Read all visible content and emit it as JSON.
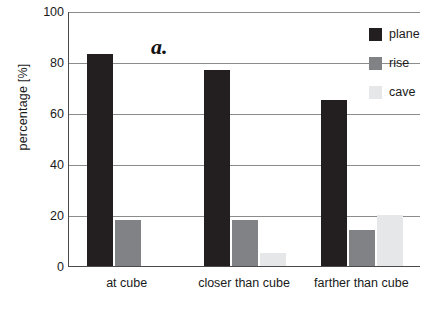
{
  "chart_data": {
    "type": "bar",
    "title": "",
    "panel_label": "a.",
    "xlabel": "",
    "ylabel": "percentage [%]",
    "ylim": [
      0,
      100
    ],
    "yticks": [
      0,
      20,
      40,
      60,
      80,
      100
    ],
    "grid": true,
    "legend_position": "top-right",
    "categories": [
      "at cube",
      "closer than cube",
      "farther than cube"
    ],
    "series": [
      {
        "name": "plane",
        "color": "#231f20",
        "values": [
          83,
          77,
          65
        ]
      },
      {
        "name": "rise",
        "color": "#808285",
        "values": [
          18,
          18,
          14
        ]
      },
      {
        "name": "cave",
        "color": "#e6e7e8",
        "values": [
          0,
          5,
          20
        ]
      }
    ]
  },
  "axes": {
    "y_tick_labels": [
      "0",
      "20",
      "40",
      "60",
      "80",
      "100"
    ],
    "y_title": "percentage [%]"
  },
  "legend": {
    "items": [
      {
        "label": "plane"
      },
      {
        "label": "rise"
      },
      {
        "label": "cave"
      }
    ]
  }
}
